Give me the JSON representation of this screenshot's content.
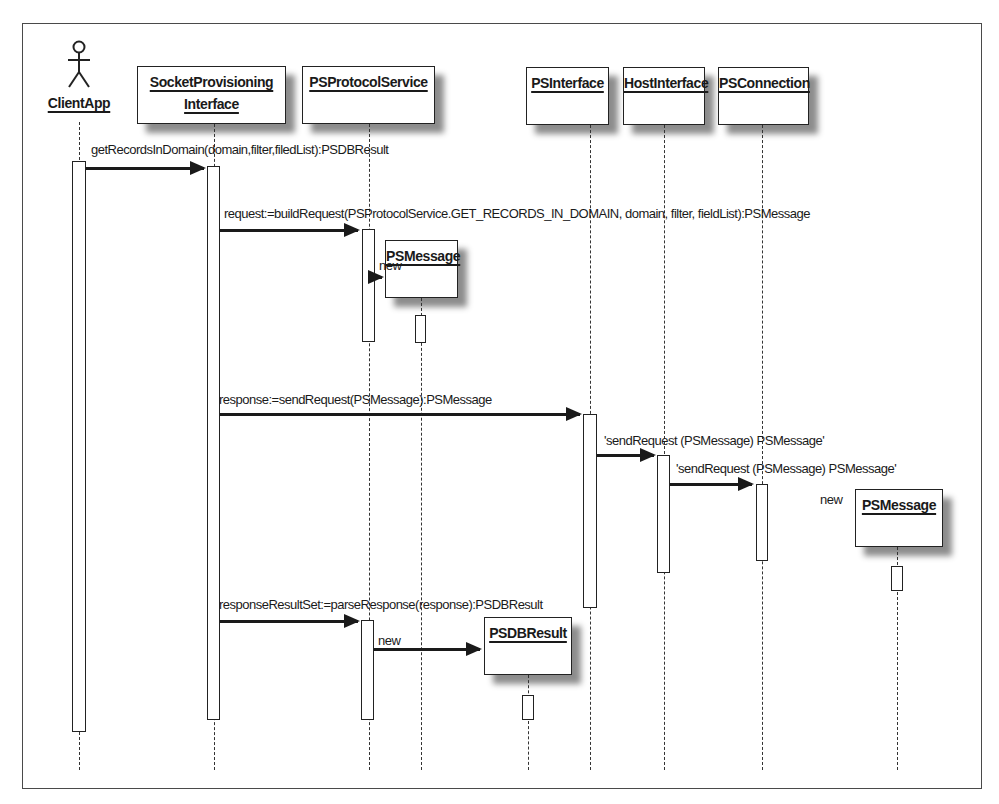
{
  "diagram": {
    "type": "UML sequence diagram",
    "actor": {
      "name": "ClientApp"
    },
    "objects": [
      {
        "id": "spi",
        "name_line1": "SocketProvisioning",
        "name_line2": "Interface"
      },
      {
        "id": "psps",
        "name": "PSProtocolService"
      },
      {
        "id": "psm1",
        "name": "PSMessage"
      },
      {
        "id": "psi",
        "name": "PSInterface"
      },
      {
        "id": "hi",
        "name": "HostInterface"
      },
      {
        "id": "psc",
        "name": "PSConnection"
      },
      {
        "id": "psm2",
        "name": "PSMessage"
      },
      {
        "id": "psdb",
        "name": "PSDBResult"
      }
    ],
    "messages": [
      {
        "from": "ClientApp",
        "to": "SocketProvisioningInterface",
        "label": "getRecordsInDomain(domain,filter,filedList):PSDBResult"
      },
      {
        "from": "SocketProvisioningInterface",
        "to": "PSProtocolService",
        "label": "request:=buildRequest(PSProtocolService.GET_RECORDS_IN_DOMAIN, domain, filter, fieldList):PSMessage"
      },
      {
        "from": "PSProtocolService",
        "to": "PSMessage",
        "label": "new"
      },
      {
        "from": "SocketProvisioningInterface",
        "to": "PSInterface",
        "label": "response:=sendRequest(PSMessage):PSMessage"
      },
      {
        "from": "PSInterface",
        "to": "HostInterface",
        "label": "'sendRequest (PSMessage) PSMessage'"
      },
      {
        "from": "HostInterface",
        "to": "PSConnection",
        "label": "'sendRequest (PSMessage) PSMessage'"
      },
      {
        "from": "PSConnection",
        "to": "PSMessage",
        "label": "new"
      },
      {
        "from": "SocketProvisioningInterface",
        "to": "PSProtocolService",
        "label": "responseResultSet:=parseResponse(response):PSDBResult"
      },
      {
        "from": "PSProtocolService",
        "to": "PSDBResult",
        "label": "new"
      }
    ]
  }
}
